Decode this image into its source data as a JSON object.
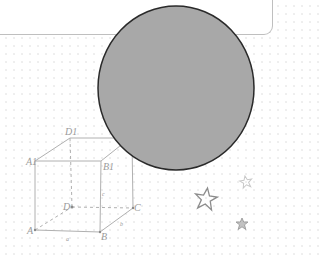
{
  "canvas": {
    "width": 278,
    "height": 256,
    "background": "#ffffff",
    "grid_dot_color": "#e6e6e6"
  },
  "note_card": {
    "border_color": "#bfbfbf"
  },
  "circle": {
    "cx": 176,
    "cy": 88,
    "rx": 78,
    "ry": 82,
    "fill": "#a8a8a8",
    "stroke": "#2a2a2a"
  },
  "cube": {
    "stroke": "#b0b0b0",
    "labels": {
      "D1": "D1",
      "A1": "A1",
      "B1": "B1",
      "D": "D",
      "C": "C",
      "A": "A",
      "B": "B",
      "edge_a": "a",
      "edge_b": "b",
      "edge_c": "c"
    }
  },
  "stars": [
    {
      "name": "large-outline-star",
      "x": 206,
      "y": 198,
      "color": "#8c8c8c"
    },
    {
      "name": "small-faint-star",
      "x": 246,
      "y": 182,
      "color": "#c8c8c8"
    },
    {
      "name": "small-filled-star",
      "x": 242,
      "y": 224,
      "color": "#9a9a9a"
    }
  ]
}
